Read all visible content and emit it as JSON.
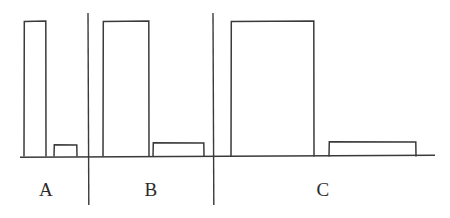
{
  "figure": {
    "title": "",
    "background_color": "#ffffff",
    "ink_color": "#3a3a3a",
    "width": 450,
    "height": 218
  },
  "chart_data": {
    "type": "bar",
    "title": "",
    "xlabel": "",
    "ylabel": "",
    "grid": false,
    "legend": null,
    "axis": {
      "baseline_y": 156,
      "baseline_x_start": 20,
      "baseline_x_end": 435,
      "ylim": [
        0,
        1.0
      ],
      "xlim": [
        0,
        450
      ]
    },
    "categories": [
      "A",
      "B",
      "C"
    ],
    "series": [
      {
        "name": "tall",
        "values": [
          1.0,
          1.0,
          1.0
        ]
      },
      {
        "name": "short",
        "values": [
          0.08,
          0.1,
          0.1
        ]
      }
    ],
    "bars": [
      {
        "group": "A",
        "series": "tall",
        "x0": 24,
        "x1": 46,
        "top": 21,
        "value": 1.0
      },
      {
        "group": "A",
        "series": "short",
        "x0": 54,
        "x1": 77,
        "top": 145,
        "value": 0.08
      },
      {
        "group": "B",
        "series": "tall",
        "x0": 103,
        "x1": 149,
        "top": 21,
        "value": 1.0
      },
      {
        "group": "B",
        "series": "short",
        "x0": 153,
        "x1": 204,
        "top": 143,
        "value": 0.1
      },
      {
        "group": "C",
        "series": "tall",
        "x0": 231,
        "x1": 314,
        "top": 21,
        "value": 1.0
      },
      {
        "group": "C",
        "series": "short",
        "x0": 329,
        "x1": 416,
        "top": 142,
        "value": 0.1
      }
    ],
    "dividers": [
      {
        "x": 88,
        "y_top": 13,
        "y_bottom": 205
      },
      {
        "x": 213,
        "y_top": 13,
        "y_bottom": 205
      }
    ],
    "group_labels": [
      {
        "text": "A",
        "x": 46,
        "y": 190
      },
      {
        "text": "B",
        "x": 151,
        "y": 190
      },
      {
        "text": "C",
        "x": 323,
        "y": 190
      }
    ]
  }
}
